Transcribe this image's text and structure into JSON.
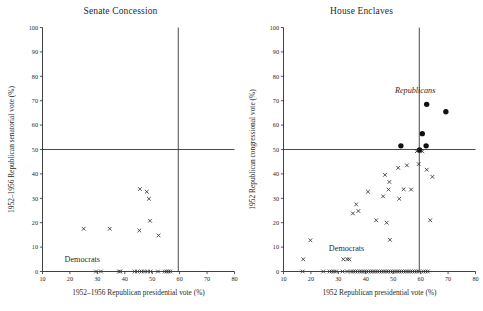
{
  "figure": {
    "width": 483,
    "height": 311,
    "background": "#ffffff",
    "ink_color": "#2b2b2b"
  },
  "panels": [
    {
      "key": "senate",
      "title": "Senate Concession",
      "xlabel": "1952–1956 Republican presidential vote (%)",
      "ylabel": "1952–1956 Republican senatorial vote (%)",
      "group_labels": [
        {
          "text": "Democrats",
          "x": 24.5,
          "y": 4.0,
          "style": "roman"
        }
      ]
    },
    {
      "key": "house",
      "title": "House Enclaves",
      "xlabel": "1952 Republican presidential vote (%)",
      "ylabel": "1952 Republican congressional vote (%)",
      "group_labels": [
        {
          "text": "Democrats",
          "x": 33.0,
          "y": 8.5,
          "style": "roman"
        },
        {
          "text": "Republicans",
          "x": 58.0,
          "y": 73.0,
          "style": "italic"
        }
      ]
    }
  ],
  "chart_data": [
    {
      "type": "scatter",
      "panel": "senate",
      "title": "Senate Concession",
      "xlabel": "1952–1956 Republican presidential vote (%)",
      "ylabel": "1952–1956 Republican senatorial vote (%)",
      "xlim": [
        10,
        80
      ],
      "ylim": [
        0,
        100
      ],
      "xticks": [
        10,
        20,
        30,
        40,
        50,
        60,
        70,
        80
      ],
      "yticks": [
        0,
        10,
        20,
        30,
        40,
        50,
        60,
        70,
        80,
        90,
        100
      ],
      "grid": false,
      "reference_lines": [
        {
          "orientation": "horizontal",
          "value": 50
        },
        {
          "orientation": "vertical",
          "value": 59.5
        }
      ],
      "legend": "none",
      "series": [
        {
          "name": "Democrats",
          "marker": "x",
          "points": [
            [
              25.0,
              17.5
            ],
            [
              34.5,
              17.5
            ],
            [
              45.3,
              16.8
            ],
            [
              45.5,
              33.8
            ],
            [
              48.0,
              32.7
            ],
            [
              48.8,
              29.8
            ],
            [
              49.2,
              20.8
            ],
            [
              52.3,
              14.8
            ],
            [
              29.5,
              0
            ],
            [
              31.3,
              0
            ],
            [
              37.9,
              0
            ],
            [
              38.4,
              0
            ],
            [
              43.6,
              0
            ],
            [
              44.6,
              0
            ],
            [
              46.1,
              0
            ],
            [
              47.0,
              0
            ],
            [
              48.2,
              0
            ],
            [
              49.4,
              0
            ],
            [
              52.1,
              0
            ],
            [
              54.6,
              0
            ],
            [
              55.3,
              0
            ],
            [
              56.0,
              0
            ],
            [
              56.6,
              0
            ]
          ]
        }
      ]
    },
    {
      "type": "scatter",
      "panel": "house",
      "title": "House Enclaves",
      "xlabel": "1952 Republican presidential vote (%)",
      "ylabel": "1952 Republican congressional vote (%)",
      "xlim": [
        10,
        80
      ],
      "ylim": [
        0,
        100
      ],
      "xticks": [
        10,
        20,
        30,
        40,
        50,
        60,
        70,
        80
      ],
      "yticks": [
        0,
        10,
        20,
        30,
        40,
        50,
        60,
        70,
        80,
        90,
        100
      ],
      "grid": false,
      "reference_lines": [
        {
          "orientation": "horizontal",
          "value": 50
        },
        {
          "orientation": "vertical",
          "value": 59.5
        }
      ],
      "legend": "none",
      "series": [
        {
          "name": "Republicans",
          "marker": "filled-circle",
          "points": [
            [
              62.2,
              68.5
            ],
            [
              69.2,
              65.5
            ],
            [
              60.6,
              56.5
            ],
            [
              52.8,
              51.5
            ],
            [
              62.0,
              51.5
            ],
            [
              59.6,
              49.8
            ]
          ]
        },
        {
          "name": "Democrats",
          "marker": "x",
          "points": [
            [
              19.8,
              12.8
            ],
            [
              17.2,
              5.0
            ],
            [
              31.8,
              5.0
            ],
            [
              33.2,
              5.0
            ],
            [
              34.0,
              5.0
            ],
            [
              35.3,
              23.8
            ],
            [
              36.5,
              27.5
            ],
            [
              37.3,
              24.8
            ],
            [
              40.8,
              32.7
            ],
            [
              43.8,
              21.0
            ],
            [
              46.3,
              30.8
            ],
            [
              47.0,
              39.6
            ],
            [
              47.6,
              20.0
            ],
            [
              48.3,
              33.6
            ],
            [
              48.6,
              36.7
            ],
            [
              48.8,
              13.0
            ],
            [
              51.8,
              42.5
            ],
            [
              52.2,
              29.8
            ],
            [
              53.8,
              33.7
            ],
            [
              55.0,
              43.5
            ],
            [
              56.5,
              33.6
            ],
            [
              58.6,
              49.3
            ],
            [
              59.3,
              44.0
            ],
            [
              60.6,
              49.2
            ],
            [
              62.2,
              41.7
            ],
            [
              63.5,
              21.0
            ],
            [
              64.3,
              38.8
            ],
            [
              17.0,
              0
            ],
            [
              24.5,
              0
            ],
            [
              26.8,
              0
            ],
            [
              27.6,
              0
            ],
            [
              28.4,
              0
            ],
            [
              29.2,
              0
            ],
            [
              31.5,
              0
            ],
            [
              33.2,
              0
            ],
            [
              34.6,
              0
            ],
            [
              35.4,
              0
            ],
            [
              36.2,
              0
            ],
            [
              37.0,
              0
            ],
            [
              37.8,
              0
            ],
            [
              38.6,
              0
            ],
            [
              39.4,
              0
            ],
            [
              40.2,
              0
            ],
            [
              41.0,
              0
            ],
            [
              41.8,
              0
            ],
            [
              42.6,
              0
            ],
            [
              43.4,
              0
            ],
            [
              44.2,
              0
            ],
            [
              45.0,
              0
            ],
            [
              45.8,
              0
            ],
            [
              46.6,
              0
            ],
            [
              47.4,
              0
            ],
            [
              48.2,
              0
            ],
            [
              49.0,
              0
            ],
            [
              49.8,
              0
            ],
            [
              50.6,
              0
            ],
            [
              51.4,
              0
            ],
            [
              52.2,
              0
            ],
            [
              53.0,
              0
            ],
            [
              53.8,
              0
            ],
            [
              54.6,
              0
            ],
            [
              55.4,
              0
            ],
            [
              56.2,
              0
            ],
            [
              57.0,
              0
            ],
            [
              57.8,
              0
            ],
            [
              58.6,
              0
            ],
            [
              59.4,
              0
            ],
            [
              61.0,
              0
            ],
            [
              61.8,
              0
            ],
            [
              62.6,
              0
            ]
          ]
        }
      ]
    }
  ]
}
